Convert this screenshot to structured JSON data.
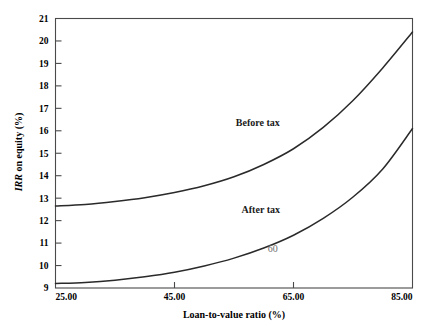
{
  "chart_data": {
    "type": "line",
    "title": "",
    "xlabel": "Loan-to-value ratio (%)",
    "ylabel": "IRR on equity (%)",
    "ylabel_italic_prefix": "IRR",
    "ylabel_rest": " on equity (%)",
    "xlim": [
      25,
      85
    ],
    "ylim": [
      9,
      21
    ],
    "grid": false,
    "legend_position": "inline-annotation",
    "xticks": [
      25,
      45,
      65,
      85
    ],
    "xtick_labels": [
      "25.00",
      "45.00",
      "65.00",
      "85.00"
    ],
    "yticks": [
      9,
      10,
      11,
      12,
      13,
      14,
      15,
      16,
      17,
      18,
      19,
      20,
      21
    ],
    "ytick_labels": [
      "9",
      "10",
      "11",
      "12",
      "13",
      "14",
      "15",
      "16",
      "17",
      "18",
      "19",
      "20",
      "21"
    ],
    "series": [
      {
        "name": "Before tax",
        "label": "Before tax",
        "color": "#2a2a2a",
        "x": [
          25,
          30,
          35,
          40,
          45,
          50,
          55,
          60,
          65,
          70,
          75,
          80,
          85
        ],
        "values": [
          12.65,
          12.72,
          12.85,
          13.02,
          13.25,
          13.55,
          13.95,
          14.5,
          15.2,
          16.15,
          17.35,
          18.8,
          20.4
        ]
      },
      {
        "name": "After tax",
        "label": "After tax",
        "color": "#2a2a2a",
        "x": [
          25,
          30,
          35,
          40,
          45,
          50,
          55,
          60,
          65,
          70,
          75,
          80,
          85
        ],
        "values": [
          9.2,
          9.25,
          9.35,
          9.5,
          9.7,
          9.98,
          10.33,
          10.78,
          11.35,
          12.1,
          13.05,
          14.3,
          16.1
        ]
      }
    ],
    "annotations": [
      {
        "text": "Before tax",
        "x": 59,
        "y": 16.2,
        "style": "curve-label"
      },
      {
        "text": "After tax",
        "x": 59.5,
        "y": 12.35,
        "style": "curve-label"
      },
      {
        "text": "60",
        "x": 61.5,
        "y": 10.6,
        "style": "annot-label"
      }
    ]
  }
}
